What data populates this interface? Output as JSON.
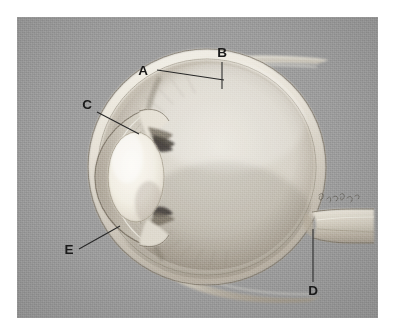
{
  "figure": {
    "medium": "pencil-shaded anatomical drawing on grey plate",
    "plate": {
      "background_color": "#9b9b9b",
      "page_color": "#ffffff",
      "left": 17,
      "top": 17,
      "width": 361,
      "height": 301
    }
  },
  "labels": [
    {
      "id": "A",
      "text": "A",
      "x": 130,
      "y": 57,
      "leader": {
        "from": [
          140,
          53
        ],
        "to": [
          207,
          63
        ]
      },
      "points_to": "upper sclera / superior rectus insertion"
    },
    {
      "id": "B",
      "text": "B",
      "x": 202,
      "y": 40,
      "leader": {
        "from": [
          206,
          44
        ],
        "to": [
          205,
          71
        ]
      },
      "points_to": "superior rectus muscle tendon"
    },
    {
      "id": "C",
      "text": "C",
      "x": 72,
      "y": 98,
      "leader": {
        "from": [
          82,
          96
        ],
        "to": [
          121,
          117
        ]
      },
      "points_to": "corneoscleral junction / limbus"
    },
    {
      "id": "D",
      "text": "D",
      "x": 310,
      "y": 282,
      "leader": {
        "from": [
          313,
          272
        ],
        "to": [
          313,
          219
        ]
      },
      "points_to": "optic nerve"
    },
    {
      "id": "E",
      "text": "E",
      "x": 61,
      "y": 241,
      "leader": {
        "from": [
          71,
          236
        ],
        "to": [
          108,
          215
        ]
      },
      "points_to": "cornea"
    }
  ],
  "structures": [
    {
      "name": "sclera",
      "description": "white fibrous outer coat forming the eyeball wall"
    },
    {
      "name": "cornea",
      "description": "transparent anterior dome at the left of the globe"
    },
    {
      "name": "anterior-chamber",
      "description": "space between cornea and iris"
    },
    {
      "name": "iris",
      "description": "dark diaphragm anterior to the lens"
    },
    {
      "name": "lens",
      "description": "bright biconvex ellipse behind the iris"
    },
    {
      "name": "ciliary-body",
      "description": "wedge of tissue at the lens periphery"
    },
    {
      "name": "vitreous-body",
      "description": "large pale chamber filling the globe"
    },
    {
      "name": "retina",
      "description": "striated inner lining of the posterior globe"
    },
    {
      "name": "choroid",
      "description": "vascular layer between retina and sclera"
    },
    {
      "name": "optic-nerve",
      "description": "thick stalk leaving the globe at lower right"
    },
    {
      "name": "superior-rectus-tendon",
      "description": "tendon strip crossing the top of the globe"
    },
    {
      "name": "inferior-rectus-tendon",
      "description": "tendon strip crossing the bottom of the globe"
    }
  ],
  "artist_signature": {
    "text": "J. Gamble",
    "legible": false,
    "x": 300,
    "y": 182
  },
  "colors": {
    "plate_grey": "#9b9b9b",
    "sclera_light": "#efece4",
    "sclera_shadow": "#b9b2a6",
    "lens_highlight": "#f6f3ea",
    "vitreous": "#d9d5cb",
    "retina_shadow": "#a59c8f",
    "iris_dark": "#4a4540",
    "label_ink": "#1a1a1a",
    "leader_ink": "#272727"
  }
}
